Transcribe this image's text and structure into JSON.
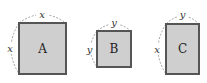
{
  "figure": {
    "shapes": [
      {
        "label": "A",
        "top_side": "x",
        "left_side": "x",
        "kind": "square"
      },
      {
        "label": "B",
        "top_side": "y",
        "left_side": "y",
        "kind": "square"
      },
      {
        "label": "C",
        "top_side": "y",
        "left_side": "x",
        "kind": "rectangle"
      }
    ]
  },
  "colors": {
    "fill": "#cfcfcf",
    "stroke": "#555555",
    "dashed_arc": "#888888"
  }
}
